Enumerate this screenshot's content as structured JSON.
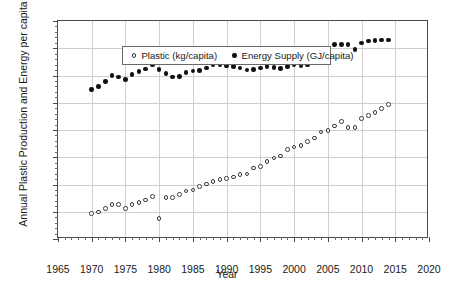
{
  "chart_data": {
    "type": "scatter",
    "title": "",
    "xlabel": "Year",
    "ylabel": "Annual Plastic Production and Energy per capita",
    "xlim": [
      1965,
      2020
    ],
    "ylim": [
      0,
      80
    ],
    "xticks": [
      1965,
      1970,
      1975,
      1980,
      1985,
      1990,
      1995,
      2000,
      2005,
      2010,
      2015,
      2020
    ],
    "yticks": [
      0,
      10,
      20,
      30,
      40,
      50,
      60,
      70,
      80
    ],
    "x_minor_tick_step": 1,
    "y_minor_tick_step": 2,
    "grid": "both",
    "legend_position": "upper-left-inside",
    "series": [
      {
        "name": "Plastic (kg/capita)",
        "marker": "open-circle",
        "color": "#3a3a3a",
        "x": [
          1970,
          1971,
          1972,
          1973,
          1974,
          1975,
          1976,
          1977,
          1978,
          1979,
          1980,
          1981,
          1982,
          1983,
          1984,
          1985,
          1986,
          1987,
          1988,
          1989,
          1990,
          1991,
          1992,
          1993,
          1994,
          1995,
          1996,
          1997,
          1998,
          1999,
          2000,
          2001,
          2002,
          2003,
          2004,
          2005,
          2006,
          2007,
          2008,
          2009,
          2010,
          2011,
          2012,
          2013,
          2014
        ],
        "y": [
          9.3,
          9.9,
          11.3,
          12.6,
          12.7,
          11.1,
          12.6,
          13.5,
          14.3,
          15.6,
          7.6,
          15.2,
          15.2,
          16.4,
          17.6,
          18.0,
          19.2,
          20.2,
          21.2,
          21.8,
          22.3,
          22.8,
          23.6,
          23.9,
          26.1,
          26.5,
          28.4,
          29.7,
          30.5,
          32.9,
          33.8,
          34.3,
          35.7,
          37.1,
          39.3,
          39.8,
          41.5,
          43.2,
          40.9,
          41.0,
          44.2,
          45.3,
          46.5,
          47.8,
          49.4
        ]
      },
      {
        "name": "Energy Supply (GJ/capita)",
        "marker": "filled-circle",
        "color": "#111111",
        "x": [
          1970,
          1971,
          1972,
          1973,
          1974,
          1975,
          1976,
          1977,
          1978,
          1979,
          1980,
          1981,
          1982,
          1983,
          1984,
          1985,
          1986,
          1987,
          1988,
          1989,
          1990,
          1991,
          1992,
          1993,
          1994,
          1995,
          1996,
          1997,
          1998,
          1999,
          2000,
          2001,
          2002,
          2003,
          2004,
          2005,
          2006,
          2007,
          2008,
          2009,
          2010,
          2011,
          2012,
          2013,
          2014
        ],
        "y": [
          54.9,
          55.9,
          57.9,
          60.1,
          59.4,
          58.5,
          60.4,
          61.4,
          62.4,
          63.8,
          62.3,
          60.8,
          59.4,
          59.6,
          61.0,
          61.6,
          61.9,
          62.8,
          63.9,
          63.9,
          63.5,
          63.2,
          62.7,
          62.0,
          62.1,
          62.8,
          63.3,
          62.9,
          62.6,
          63.3,
          63.8,
          63.5,
          63.8,
          65.3,
          68.0,
          69.2,
          71.3,
          71.3,
          71.3,
          69.5,
          72.0,
          72.7,
          72.8,
          73.0,
          73.1
        ]
      }
    ]
  },
  "legend": {
    "entries": [
      {
        "label": "Plastic (kg/capita)",
        "marker": "open-circle"
      },
      {
        "label": "Energy Supply (GJ/capita)",
        "marker": "filled-circle"
      }
    ]
  },
  "axes": {
    "x_title": "Year",
    "y_title": "Annual Plastic Production and Energy per capita"
  }
}
